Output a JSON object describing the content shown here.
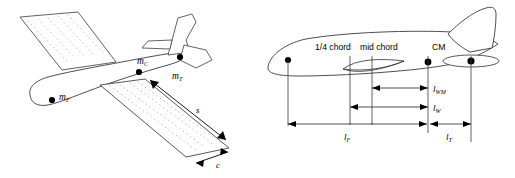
{
  "figure": {
    "background": "#ffffff",
    "stroke": "#3a3a3a",
    "text_color": "#000000",
    "panels": [
      {
        "id": "left",
        "name": "isometric-aircraft-mass-distribution",
        "description": "Three-quarter isometric view of an aircraft showing lumped mass points and wing planform dimensions",
        "mass_points": [
          {
            "key": "mF",
            "label": "m",
            "subscript": "F",
            "meaning": "fuselage mass",
            "x": 57,
            "y": 98
          },
          {
            "key": "mC",
            "label": "m",
            "subscript": "C",
            "meaning": "centre mass",
            "x": 140,
            "y": 72
          },
          {
            "key": "mT",
            "label": "m",
            "subscript": "T",
            "meaning": "tail mass",
            "x": 182,
            "y": 57
          }
        ],
        "dimensions": [
          {
            "key": "s",
            "label": "s",
            "meaning": "wing span",
            "x": 196,
            "y": 110
          },
          {
            "key": "c",
            "label": "c",
            "meaning": "wing chord",
            "x": 221,
            "y": 164
          }
        ]
      },
      {
        "id": "right",
        "name": "side-view-longitudinal-distances",
        "description": "Side elevation of an aircraft with longitudinal station markers and dimension lines",
        "stations": [
          {
            "key": "quarter_chord",
            "label": "1/4 chord",
            "x": 340,
            "y": 51
          },
          {
            "key": "mid_chord",
            "label": "mid chord",
            "x": 382,
            "y": 51
          },
          {
            "key": "cm",
            "label": "CM",
            "meaning": "centre of mass",
            "x": 440,
            "y": 51
          }
        ],
        "dimensions": [
          {
            "key": "lWM",
            "label": "l",
            "subscript": "WM",
            "meaning": "mid chord to CM",
            "x": 443,
            "y": 90
          },
          {
            "key": "lW",
            "label": "l",
            "subscript": "W",
            "meaning": "quarter chord to CM",
            "x": 443,
            "y": 109
          },
          {
            "key": "lF",
            "label": "l",
            "subscript": "F",
            "meaning": "nose to CM",
            "x": 348,
            "y": 139
          },
          {
            "key": "lT",
            "label": "l",
            "subscript": "T",
            "meaning": "CM to tail",
            "x": 460,
            "y": 139
          }
        ]
      }
    ]
  }
}
